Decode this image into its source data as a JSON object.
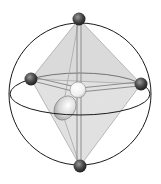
{
  "diagram": {
    "type": "molecular-geometry",
    "colors": {
      "background": "#ffffff",
      "sphere_outline": "#1a1a1a",
      "face_fill": "#bdbdbd",
      "bond": "#9a9a9a",
      "ligand_atom": "#3c3c3c",
      "central_atom": "#f4f4f4",
      "lone_pair": "#d0d0d0"
    },
    "sphere": {
      "cx": 80,
      "cy": 94,
      "r": 71
    },
    "equator": {
      "cx": 80,
      "cy": 94,
      "rx": 70,
      "ry": 21
    },
    "central_atom": {
      "x": 78,
      "y": 90,
      "r": 8
    },
    "ligands": [
      {
        "name": "axial-top",
        "x": 79,
        "y": 19,
        "r": 6.5
      },
      {
        "name": "equatorial-left",
        "x": 31,
        "y": 79,
        "r": 6.5
      },
      {
        "name": "equatorial-right",
        "x": 141,
        "y": 84,
        "r": 6.5
      },
      {
        "name": "axial-bottom",
        "x": 80,
        "y": 166,
        "r": 6.5
      }
    ],
    "lone_pair": {
      "x": 65,
      "y": 108,
      "rx": 10,
      "ry": 13,
      "rotate": 35
    }
  }
}
